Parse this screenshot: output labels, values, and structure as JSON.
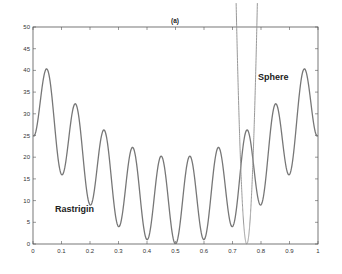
{
  "chart_data": {
    "type": "line",
    "title": "(a)",
    "xlabel": "",
    "ylabel": "",
    "xlim": [
      0,
      1
    ],
    "ylim": [
      0,
      50
    ],
    "xticks": [
      0,
      0.1,
      0.2,
      0.3,
      0.4,
      0.5,
      0.6,
      0.7,
      0.8,
      0.9,
      1
    ],
    "xtick_labels": [
      "0",
      "0.1",
      "0.2",
      "0.3",
      "0.4",
      "0.5",
      "0.6",
      "0.7",
      "0.8",
      "0.9",
      "1"
    ],
    "yticks": [
      0,
      5,
      10,
      15,
      20,
      25,
      30,
      35,
      40,
      45,
      50
    ],
    "ytick_labels": [
      "0",
      "5",
      "10",
      "15",
      "20",
      "25",
      "30",
      "35",
      "40",
      "45",
      "50"
    ],
    "grid": false,
    "legend": null,
    "series": [
      {
        "name": "Rastrigin",
        "formula": "100*(x-0.5)^2 + 10*(1 - cos(20*pi*x))",
        "key_points": {
          "x": [
            0,
            0.05,
            0.1,
            0.15,
            0.2,
            0.25,
            0.3,
            0.35,
            0.4,
            0.45,
            0.5,
            0.55,
            0.6,
            0.65,
            0.7,
            0.75,
            0.8,
            0.85,
            0.9,
            0.95,
            1.0
          ],
          "y": [
            25,
            40.25,
            16,
            32.25,
            9,
            26.25,
            4,
            22.25,
            1,
            20.25,
            0,
            20.25,
            1,
            22.25,
            4,
            26.25,
            9,
            32.25,
            16,
            40.25,
            25
          ]
        },
        "color": "#777777"
      },
      {
        "name": "Sphere",
        "formula": "40000*(x-0.75)^2",
        "key_points": {
          "x": [
            0.715,
            0.73,
            0.75,
            0.77,
            0.785
          ],
          "y": [
            49,
            16,
            0,
            16,
            49
          ]
        },
        "color": "#999999"
      }
    ],
    "annotations": [
      {
        "text": "Rastrigin",
        "x": 0.08,
        "y": 8
      },
      {
        "text": "Sphere",
        "x": 0.79,
        "y": 39
      }
    ]
  },
  "labels": {
    "title": "(a)",
    "rastrigin": "Rastrigin",
    "sphere": "Sphere"
  }
}
